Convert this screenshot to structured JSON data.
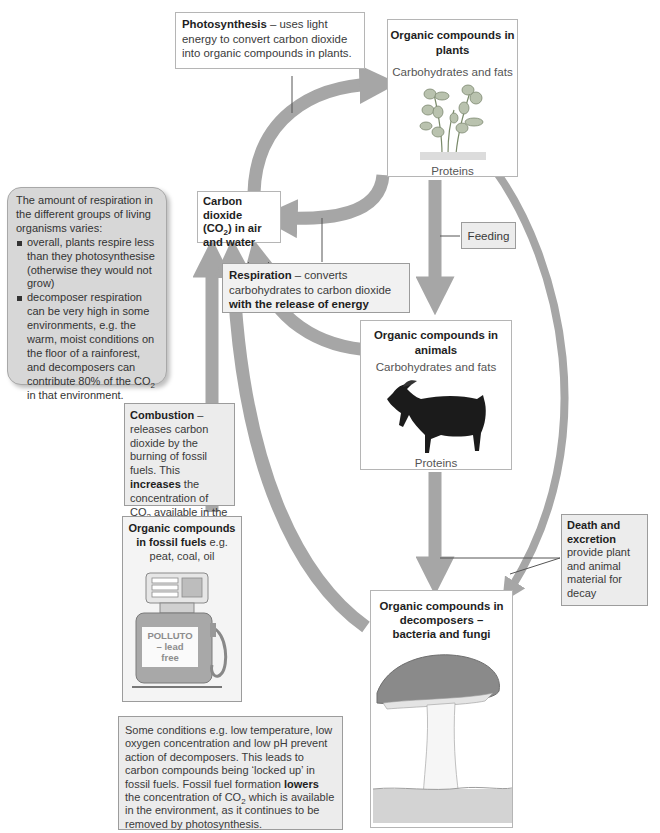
{
  "diagram": {
    "type": "carbon-cycle",
    "colors": {
      "arrow_fill": "#a6a6a6",
      "box_border": "#b5b5b5",
      "grey_box": "#ececec",
      "note_bg": "#d7d7d7"
    },
    "photosynthesis_box": {
      "title": "Photosynthesis",
      "text": " – uses light energy to convert carbon dioxide into organic compounds in plants."
    },
    "plants_box": {
      "title": "Organic compounds in plants",
      "top_label": "Carbohydrates and fats",
      "bottom_label": "Proteins",
      "image": "plant-illustration"
    },
    "co2_box": {
      "line1": "Carbon dioxide",
      "line2_pre": "(CO",
      "line2_sub": "2",
      "line2_post": ") in air",
      "line3": "and water"
    },
    "feeding_label": "Feeding",
    "respiration_box": {
      "title": "Respiration",
      "text": " – converts carbohydrates to carbon dioxide ",
      "bold_end": "with the release of energy"
    },
    "respiration_note": {
      "intro": "The amount of respiration in the different groups of living organisms varies:",
      "bullets": [
        "overall, plants respire less than they photosynthesise (otherwise they would not grow)",
        "decomposer respiration can be very high in some environments, e.g. the warm, moist conditions on the floor of a rainforest, and decomposers can contribute 80% of the CO"
      ],
      "bullet2_sub": "2",
      "bullet2_end": " in that environment."
    },
    "animals_box": {
      "title": "Organic compounds in animals",
      "top_label": "Carbohydrates and fats",
      "bottom_label": "Proteins",
      "image": "goat-illustration"
    },
    "combustion_box": {
      "title": "Combustion",
      "text1": " – releases carbon dioxide by the burning of fossil fuels. This ",
      "bold": "increases",
      "text2": " the concentration of CO",
      "sub": "2",
      "text3": " available in the environment."
    },
    "fossil_box": {
      "title": "Organic compounds in fossil fuels",
      "text": " e.g. peat, coal, oil",
      "pump_label_1": "POLLUTO",
      "pump_label_2": "– lead",
      "pump_label_3": "free",
      "image": "fuel-pump-illustration"
    },
    "death_box": {
      "title": "Death and excretion",
      "text": " provide plant and animal material for decay"
    },
    "decomposers_box": {
      "title": "Organic compounds in decomposers – bacteria and fungi",
      "image": "mushroom-illustration"
    },
    "conditions_box": {
      "text1": "Some conditions e.g. low temperature, low oxygen concentration and low pH prevent action of decomposers. This leads to carbon compounds being ‘locked up’ in fossil fuels. Fossil fuel formation ",
      "bold": "lowers",
      "text2": " the concentration of CO",
      "sub": "2",
      "text3": " which is available in the environment, as it continues to be removed by photosynthesis."
    }
  }
}
